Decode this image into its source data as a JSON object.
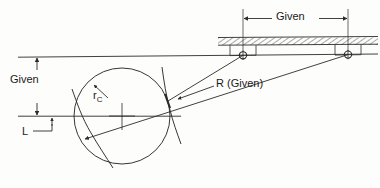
{
  "diagram": {
    "type": "engineering-line-drawing",
    "width": 380,
    "height": 188,
    "background_color": "#fdfdfb",
    "line_color": "#2b2b2b",
    "labels": {
      "given_horizontal": "Given",
      "given_vertical": "Given",
      "link_length": "L",
      "cam_radius_base": "r",
      "cam_radius_subscript": "C",
      "radius_given": "R (Given)"
    },
    "elements": {
      "ground_surface": {
        "name": "hatched-ground-surface",
        "hatch_angle_deg": 60,
        "x_start": 218,
        "x_end": 378,
        "y_top": 37,
        "y_bottom": 45
      },
      "pivot_left": {
        "name": "pin-joint-left",
        "cx": 243,
        "cy": 55,
        "r": 3.6
      },
      "pivot_right": {
        "name": "pin-joint-right",
        "cx": 348,
        "cy": 55,
        "r": 3.6
      },
      "circle_cam": {
        "name": "cam-circle",
        "cx": 122,
        "cy": 116,
        "r": 48
      },
      "reference_line_upper": {
        "name": "upper-reference-line",
        "x1": 18,
        "y1": 57,
        "x2": 378,
        "y2": 54
      },
      "reference_line_lower": {
        "name": "lower-reference-line",
        "x1": 18,
        "y1": 116,
        "x2": 181,
        "y2": 116
      },
      "dimension_given_horizontal": {
        "from_x": 243,
        "to_x": 348,
        "y": 18
      },
      "dimension_given_vertical": {
        "x": 37,
        "from_y": 57,
        "to_y": 116
      }
    }
  }
}
